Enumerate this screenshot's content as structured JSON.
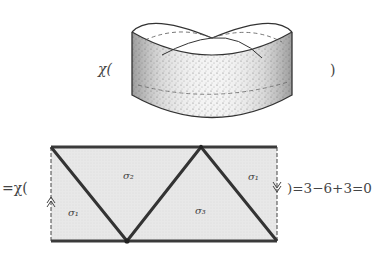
{
  "figure": {
    "top_equation": {
      "prefix": "χ(",
      "suffix": ")"
    },
    "bottom_equation": {
      "prefix": "=χ(",
      "suffix": ")=3−6+3=0"
    },
    "regions": [
      {
        "label": "σ₂",
        "position": "upper-left"
      },
      {
        "label": "σ₁",
        "position": "lower-left"
      },
      {
        "label": "σ₃",
        "position": "lower-middle"
      },
      {
        "label": "σ₁",
        "position": "upper-right"
      }
    ],
    "colors": {
      "fill": "#e6e6e6",
      "edge": "#3a3a3a"
    }
  }
}
